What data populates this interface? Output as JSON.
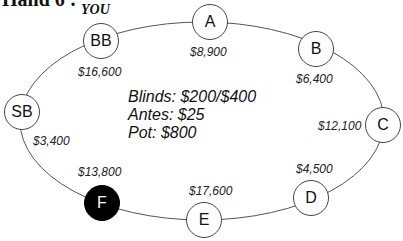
{
  "title": "Hand 6 :",
  "hero_label": "YOU",
  "info": {
    "blinds": "Blinds: $200/$400",
    "antes": "Antes: $25",
    "pot": "Pot: $800"
  },
  "seats": [
    {
      "label": "BB",
      "stack": "$16,600",
      "hero": true
    },
    {
      "label": "A",
      "stack": "$8,900"
    },
    {
      "label": "B",
      "stack": "$6,400"
    },
    {
      "label": "C",
      "stack": "$12,100"
    },
    {
      "label": "D",
      "stack": "$4,500"
    },
    {
      "label": "E",
      "stack": "$17,600"
    },
    {
      "label": "F",
      "stack": "$13,800",
      "highlighted": true
    },
    {
      "label": "SB",
      "stack": "$3,400"
    }
  ]
}
